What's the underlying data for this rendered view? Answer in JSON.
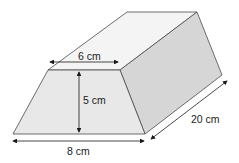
{
  "diagram": {
    "type": "trapezoidal-prism",
    "labels": {
      "top_width": "6 cm",
      "height": "5 cm",
      "bottom_width": "8 cm",
      "length": "20 cm"
    },
    "colors": {
      "front_face": "#e8e8e8",
      "top_face": "#f4f4f4",
      "side_face": "#d6d6d6",
      "edge": "#4a4a4a",
      "arrow": "#1a1a1a"
    }
  }
}
